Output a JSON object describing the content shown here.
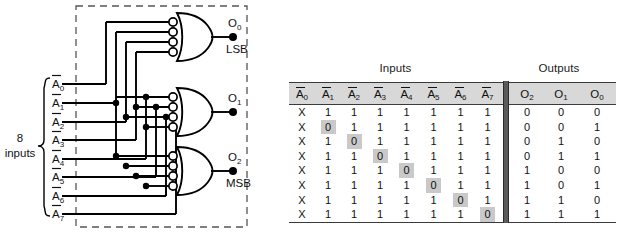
{
  "circuit": {
    "inputs_brace_label_line1": "8",
    "inputs_brace_label_line2": "inputs",
    "input_labels": [
      "A0",
      "A1",
      "A2",
      "A3",
      "A4",
      "A5",
      "A6",
      "A7"
    ],
    "input_label_bases": [
      "A",
      "A",
      "A",
      "A",
      "A",
      "A",
      "A",
      "A"
    ],
    "input_label_subs": [
      "0",
      "1",
      "2",
      "3",
      "4",
      "5",
      "6",
      "7"
    ],
    "outputs": [
      {
        "base": "O",
        "sub": "0",
        "note": "LSB"
      },
      {
        "base": "O",
        "sub": "1",
        "note": ""
      },
      {
        "base": "O",
        "sub": "2",
        "note": "MSB"
      }
    ],
    "gate_type": "or-gate-with-inverting-inputs",
    "gate_count": 3,
    "gate_inputs_each": 4,
    "boundary_style": "dashed"
  },
  "table": {
    "group_titles": {
      "inputs": "Inputs",
      "outputs": "Outputs"
    },
    "input_headers": [
      {
        "base": "A",
        "sub": "0"
      },
      {
        "base": "A",
        "sub": "1"
      },
      {
        "base": "A",
        "sub": "2"
      },
      {
        "base": "A",
        "sub": "3"
      },
      {
        "base": "A",
        "sub": "4"
      },
      {
        "base": "A",
        "sub": "5"
      },
      {
        "base": "A",
        "sub": "6"
      },
      {
        "base": "A",
        "sub": "7"
      }
    ],
    "output_headers": [
      {
        "base": "O",
        "sub": "2"
      },
      {
        "base": "O",
        "sub": "1"
      },
      {
        "base": "O",
        "sub": "0"
      }
    ],
    "rows": [
      {
        "inputs": [
          "X",
          "1",
          "1",
          "1",
          "1",
          "1",
          "1",
          "1"
        ],
        "highlight": -1,
        "outputs": [
          "0",
          "0",
          "0"
        ]
      },
      {
        "inputs": [
          "X",
          "0",
          "1",
          "1",
          "1",
          "1",
          "1",
          "1"
        ],
        "highlight": 1,
        "outputs": [
          "0",
          "0",
          "1"
        ]
      },
      {
        "inputs": [
          "X",
          "1",
          "0",
          "1",
          "1",
          "1",
          "1",
          "1"
        ],
        "highlight": 2,
        "outputs": [
          "0",
          "1",
          "0"
        ]
      },
      {
        "inputs": [
          "X",
          "1",
          "1",
          "0",
          "1",
          "1",
          "1",
          "1"
        ],
        "highlight": 3,
        "outputs": [
          "0",
          "1",
          "1"
        ]
      },
      {
        "inputs": [
          "X",
          "1",
          "1",
          "1",
          "0",
          "1",
          "1",
          "1"
        ],
        "highlight": 4,
        "outputs": [
          "1",
          "0",
          "0"
        ]
      },
      {
        "inputs": [
          "X",
          "1",
          "1",
          "1",
          "1",
          "0",
          "1",
          "1"
        ],
        "highlight": 5,
        "outputs": [
          "1",
          "0",
          "1"
        ]
      },
      {
        "inputs": [
          "X",
          "1",
          "1",
          "1",
          "1",
          "1",
          "0",
          "1"
        ],
        "highlight": 6,
        "outputs": [
          "1",
          "1",
          "0"
        ]
      },
      {
        "inputs": [
          "X",
          "1",
          "1",
          "1",
          "1",
          "1",
          "1",
          "0"
        ],
        "highlight": 7,
        "outputs": [
          "1",
          "1",
          "1"
        ]
      }
    ]
  },
  "colors": {
    "highlight": "#c9c9c9",
    "header_band": "#d8d8d8",
    "rule": "#3a3a3a",
    "separator": "#5a5a5a",
    "ink": "#111111"
  }
}
